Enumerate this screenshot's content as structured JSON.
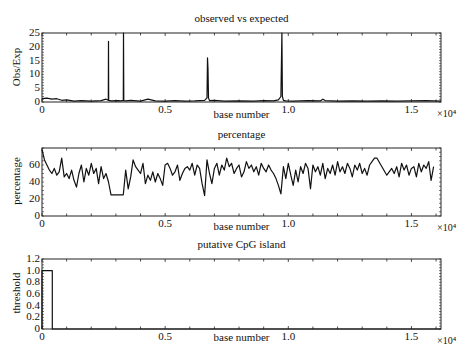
{
  "figure": {
    "width": 461,
    "height": 362,
    "line_color": "#111111",
    "axis_color": "#222222",
    "background": "#ffffff"
  },
  "chart_data": [
    {
      "type": "line",
      "title": "observed vs expected",
      "xlabel": "base number",
      "ylabel": "Obs/Exp",
      "xlim": [
        0,
        16200
      ],
      "ylim": [
        0,
        25
      ],
      "x_tick_labels": [
        "0",
        "0.5",
        "1.0",
        "1.5"
      ],
      "x_tick_values": [
        0,
        5000,
        10000,
        15000
      ],
      "x_multiplier": "×10⁴",
      "y_tick_labels": [
        "0",
        "5",
        "10",
        "15",
        "20",
        "25"
      ],
      "y_tick_values": [
        0,
        5,
        10,
        15,
        20,
        25
      ],
      "grid": false,
      "x": [
        0,
        200,
        400,
        600,
        800,
        1000,
        1300,
        1600,
        2000,
        2400,
        2600,
        2690,
        2700,
        2710,
        2800,
        3100,
        3200,
        3300,
        3310,
        3320,
        3400,
        3600,
        4000,
        4300,
        4600,
        5000,
        5400,
        5800,
        6200,
        6600,
        6700,
        6720,
        6740,
        6760,
        6800,
        7000,
        7400,
        8000,
        8600,
        9000,
        9400,
        9600,
        9700,
        9740,
        9760,
        9800,
        9900,
        10200,
        10800,
        11300,
        11400,
        11500,
        12000,
        12600,
        13200,
        13800,
        14400,
        15000,
        15600,
        16200
      ],
      "values": [
        1.2,
        1.4,
        1.0,
        1.2,
        0.6,
        0.8,
        0.3,
        0.5,
        0.3,
        0.5,
        1.0,
        0.6,
        22,
        0.6,
        0.4,
        0.5,
        0.4,
        0.6,
        25,
        0.5,
        0.4,
        0.6,
        0.3,
        1.0,
        0.4,
        0.3,
        0.5,
        0.3,
        0.4,
        0.6,
        1.5,
        16,
        12,
        1.5,
        0.5,
        0.6,
        0.3,
        0.4,
        0.3,
        0.5,
        0.4,
        0.8,
        2.0,
        25,
        2.0,
        0.6,
        0.4,
        0.3,
        0.5,
        0.4,
        1.0,
        0.5,
        0.3,
        0.4,
        0.3,
        0.4,
        0.3,
        0.4,
        0.5,
        0.3
      ]
    },
    {
      "type": "line",
      "title": "percentage",
      "xlabel": "base number",
      "ylabel": "percentage",
      "xlim": [
        0,
        16200
      ],
      "ylim": [
        0,
        80
      ],
      "x_tick_labels": [
        "0",
        "0.5",
        "1.0",
        "1.5"
      ],
      "x_tick_values": [
        0,
        5000,
        10000,
        15000
      ],
      "x_multiplier": "×10⁴",
      "y_tick_labels": [
        "0",
        "20",
        "40",
        "60"
      ],
      "y_tick_values": [
        0,
        20,
        40,
        60
      ],
      "grid": false,
      "x": [
        0,
        100,
        200,
        300,
        400,
        500,
        600,
        700,
        800,
        900,
        1000,
        1100,
        1200,
        1300,
        1400,
        1500,
        1600,
        1700,
        1800,
        1900,
        2000,
        2100,
        2200,
        2300,
        2400,
        2500,
        2600,
        2700,
        2800,
        3000,
        3200,
        3300,
        3400,
        3500,
        3600,
        3700,
        3800,
        3900,
        4000,
        4100,
        4200,
        4300,
        4400,
        4500,
        4600,
        4700,
        4800,
        4900,
        5000,
        5100,
        5200,
        5300,
        5400,
        5500,
        5600,
        5700,
        5800,
        5900,
        6000,
        6100,
        6200,
        6300,
        6400,
        6500,
        6600,
        6700,
        6800,
        6900,
        7000,
        7100,
        7200,
        7300,
        7400,
        7500,
        7600,
        7700,
        7800,
        7900,
        8000,
        8100,
        8200,
        8300,
        8400,
        8500,
        8600,
        8700,
        8800,
        8900,
        9000,
        9100,
        9200,
        9300,
        9400,
        9500,
        9600,
        9700,
        9800,
        9900,
        10000,
        10100,
        10200,
        10300,
        10400,
        10500,
        10600,
        10700,
        10800,
        10900,
        11000,
        11100,
        11200,
        11300,
        11400,
        11500,
        11600,
        11700,
        11800,
        11900,
        12000,
        12100,
        12200,
        12300,
        12400,
        12500,
        12600,
        12700,
        12800,
        12900,
        13000,
        13100,
        13200,
        13300,
        13400,
        13500,
        13600,
        13800,
        14000,
        14200,
        14300,
        14400,
        14500,
        14600,
        14700,
        14800,
        14900,
        15000,
        15100,
        15200,
        15300,
        15400,
        15500,
        15600,
        15700,
        15800,
        15900,
        16000,
        16100,
        16200
      ],
      "values": [
        78,
        66,
        60,
        54,
        50,
        56,
        48,
        52,
        68,
        46,
        50,
        44,
        54,
        42,
        34,
        50,
        60,
        40,
        56,
        48,
        62,
        50,
        56,
        38,
        58,
        44,
        50,
        40,
        25,
        25,
        25,
        25,
        54,
        32,
        46,
        66,
        58,
        54,
        50,
        62,
        38,
        48,
        42,
        52,
        40,
        50,
        44,
        36,
        60,
        62,
        56,
        48,
        52,
        60,
        42,
        50,
        56,
        58,
        54,
        62,
        48,
        60,
        56,
        38,
        24,
        66,
        50,
        38,
        56,
        62,
        48,
        60,
        54,
        68,
        58,
        62,
        50,
        56,
        60,
        46,
        52,
        64,
        56,
        60,
        52,
        58,
        48,
        62,
        56,
        52,
        60,
        54,
        50,
        44,
        36,
        26,
        58,
        44,
        62,
        48,
        36,
        54,
        40,
        58,
        50,
        62,
        56,
        32,
        60,
        52,
        58,
        48,
        62,
        44,
        56,
        50,
        60,
        48,
        64,
        52,
        58,
        50,
        62,
        56,
        46,
        60,
        54,
        62,
        50,
        56,
        48,
        60,
        64,
        68,
        68,
        58,
        48,
        56,
        50,
        58,
        46,
        62,
        54,
        60,
        48,
        56,
        58,
        46,
        62,
        52,
        60,
        56,
        64,
        42,
        58
      ]
    },
    {
      "type": "line",
      "title": "putative  CpG island",
      "xlabel": "base number",
      "ylabel": "threshold",
      "xlim": [
        0,
        16200
      ],
      "ylim": [
        0,
        1.2
      ],
      "x_tick_labels": [
        "0",
        "0.5",
        "1.0",
        "1.5"
      ],
      "x_tick_values": [
        0,
        5000,
        10000,
        15000
      ],
      "x_multiplier": "×10⁴",
      "y_tick_labels": [
        "0",
        "0.2",
        "0.4",
        "0.6",
        "0.8",
        "1.0",
        "1.2"
      ],
      "y_tick_values": [
        0,
        0.2,
        0.4,
        0.6,
        0.8,
        1.0,
        1.2
      ],
      "grid": false,
      "x": [
        0,
        0,
        420,
        420,
        16200
      ],
      "values": [
        0,
        1.0,
        1.0,
        0,
        0
      ]
    }
  ],
  "layout": {
    "panels": [
      {
        "left": 42,
        "right": 441,
        "top": 33,
        "bottom": 102,
        "title_y": 12,
        "xlabel_y": 121,
        "minor_y_ticks": 25
      },
      {
        "left": 42,
        "right": 441,
        "top": 148,
        "bottom": 216,
        "title_y": 128,
        "xlabel_y": 233,
        "minor_y_ticks": 16
      },
      {
        "left": 42,
        "right": 441,
        "top": 259,
        "bottom": 329,
        "title_y": 238,
        "xlabel_y": 344,
        "minor_y_ticks": 24
      }
    ]
  }
}
